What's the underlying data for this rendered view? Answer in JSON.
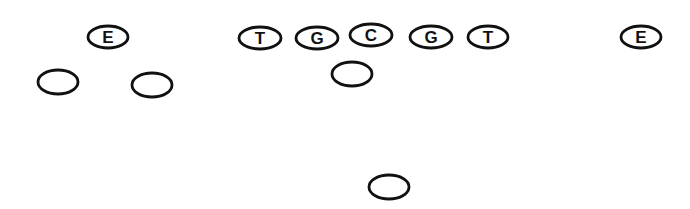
{
  "diagram": {
    "title": "",
    "colors": {
      "stroke": "#111111",
      "fill": "#ffffff",
      "background": "#ffffff"
    },
    "players": [
      {
        "id": "left-end",
        "label": "E",
        "role": "End"
      },
      {
        "id": "left-tackle",
        "label": "T",
        "role": "Tackle"
      },
      {
        "id": "left-guard",
        "label": "G",
        "role": "Guard"
      },
      {
        "id": "center",
        "label": "C",
        "role": "Center"
      },
      {
        "id": "right-guard",
        "label": "G",
        "role": "Guard"
      },
      {
        "id": "right-tackle",
        "label": "T",
        "role": "Tackle"
      },
      {
        "id": "right-end",
        "label": "E",
        "role": "End"
      },
      {
        "id": "left-wingback",
        "label": "",
        "role": "Back"
      },
      {
        "id": "left-slotback",
        "label": "",
        "role": "Back"
      },
      {
        "id": "quarterback",
        "label": "",
        "role": "Back"
      },
      {
        "id": "deep-back",
        "label": "",
        "role": "Back"
      }
    ]
  }
}
